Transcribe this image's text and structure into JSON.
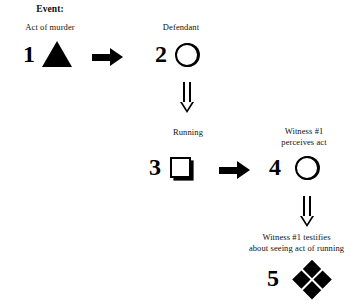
{
  "diagram": {
    "title": "Event:",
    "type": "causal-chain-flowchart",
    "background_color": "#ffffff",
    "ink_color": "#000000",
    "nodes": [
      {
        "number": "1",
        "label": "Act of murder",
        "shape": "triangle-filled"
      },
      {
        "number": "2",
        "label": "Defendant",
        "shape": "circle-outline"
      },
      {
        "number": "3",
        "label": "Running",
        "shape": "square-outline-shadow"
      },
      {
        "number": "4",
        "label": "Witness #1\nperceives act",
        "shape": "circle-outline"
      },
      {
        "number": "5",
        "label": "Witness #1 testifies\nabout seeing act of running",
        "shape": "quad-diamond-filled"
      }
    ],
    "connectors": [
      {
        "from": "1",
        "to": "2",
        "style": "solid-arrow",
        "direction": "right"
      },
      {
        "from": "2",
        "to": "3",
        "style": "hollow-double-arrow",
        "direction": "down"
      },
      {
        "from": "3",
        "to": "4",
        "style": "solid-arrow",
        "direction": "right"
      },
      {
        "from": "4",
        "to": "5",
        "style": "hollow-double-arrow",
        "direction": "down"
      }
    ]
  }
}
